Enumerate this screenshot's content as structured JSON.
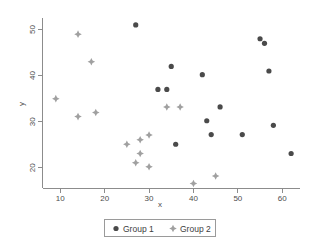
{
  "chart_data": {
    "type": "scatter",
    "title": "",
    "xlabel": "x",
    "ylabel": "y",
    "xlim": [
      6,
      64
    ],
    "ylim": [
      15.5,
      52.5
    ],
    "xticks": [
      10,
      20,
      30,
      40,
      50,
      60
    ],
    "yticks": [
      20,
      30,
      40,
      50
    ],
    "grid": false,
    "legend_position": "bottom-center",
    "series": [
      {
        "name": "Group 1",
        "marker": "circle",
        "color": "#4a4a4a",
        "points": [
          [
            27,
            51
          ],
          [
            55,
            48
          ],
          [
            56,
            47
          ],
          [
            35,
            42
          ],
          [
            57,
            41
          ],
          [
            42,
            40.2
          ],
          [
            32,
            37
          ],
          [
            34,
            37
          ],
          [
            46,
            33.2
          ],
          [
            43,
            30.2
          ],
          [
            58,
            29.2
          ],
          [
            44,
            27.2
          ],
          [
            51,
            27.2
          ],
          [
            36,
            25.1
          ],
          [
            62,
            23.1
          ]
        ]
      },
      {
        "name": "Group 2",
        "marker": "diamond",
        "color": "#a0a0a0",
        "points": [
          [
            14,
            49
          ],
          [
            17,
            43
          ],
          [
            9,
            35
          ],
          [
            37,
            33.2
          ],
          [
            34,
            33.2
          ],
          [
            18,
            32
          ],
          [
            14,
            31.1
          ],
          [
            30,
            27.1
          ],
          [
            28,
            26.1
          ],
          [
            25,
            25.1
          ],
          [
            28,
            23.1
          ],
          [
            27,
            21.1
          ],
          [
            30,
            20.2
          ],
          [
            45,
            18.2
          ],
          [
            40,
            16.6
          ]
        ]
      }
    ]
  },
  "legend": {
    "items": [
      {
        "label": "Group 1",
        "marker": "circle",
        "color": "#4a4a4a"
      },
      {
        "label": "Group 2",
        "marker": "diamond",
        "color": "#a0a0a0"
      }
    ]
  },
  "axes": {
    "x_title": "x",
    "y_title": "y"
  }
}
